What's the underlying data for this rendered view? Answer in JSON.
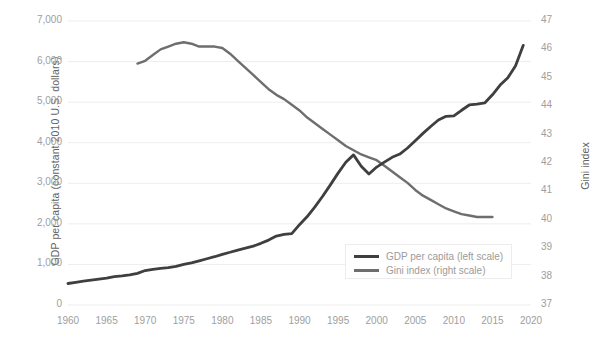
{
  "chart_data": {
    "type": "line",
    "title": "",
    "subtitle": "",
    "xlabel": "",
    "ylabel": "GDP per capita (constant 2010 U.S. dollars)",
    "y2label": "Gini index",
    "grid": true,
    "legend_position": "inside-bottom-right",
    "xlim": [
      1960,
      2020
    ],
    "xticks": [
      "1960",
      "1965",
      "1970",
      "1975",
      "1980",
      "1985",
      "1990",
      "1995",
      "2000",
      "2005",
      "2010",
      "2015",
      "2020"
    ],
    "ylim": [
      0,
      7000
    ],
    "yticks": [
      "0",
      "1,000",
      "2,000",
      "3,000",
      "4,000",
      "5,000",
      "6,000",
      "7,000"
    ],
    "y2lim": [
      37,
      47
    ],
    "y2ticks": [
      "37",
      "38",
      "39",
      "40",
      "41",
      "42",
      "43",
      "44",
      "45",
      "46",
      "47"
    ],
    "colors": {
      "gdp_line": "#3f3f3f",
      "gini_line": "#6e6e6e",
      "gridline": "#ededed",
      "tick_text": "#9e9e9e",
      "axis_title_text": "#636363",
      "legend_text": "#9b9b9b",
      "legend_border": "#ececec",
      "background": "#ffffff"
    },
    "series": [
      {
        "name": "GDP per capita (left scale)",
        "axis": "left",
        "legend_label": "GDP per capita (left scale)",
        "color": "#3f3f3f",
        "x": [
          1960,
          1961,
          1962,
          1963,
          1964,
          1965,
          1966,
          1967,
          1968,
          1969,
          1970,
          1971,
          1972,
          1973,
          1974,
          1975,
          1976,
          1977,
          1978,
          1979,
          1980,
          1981,
          1982,
          1983,
          1984,
          1985,
          1986,
          1987,
          1988,
          1989,
          1990,
          1991,
          1992,
          1993,
          1994,
          1995,
          1996,
          1997,
          1998,
          1999,
          2000,
          2001,
          2002,
          2003,
          2004,
          2005,
          2006,
          2007,
          2008,
          2009,
          2010,
          2011,
          2012,
          2013,
          2014,
          2015,
          2016,
          2017,
          2018,
          2019
        ],
        "values": [
          530,
          560,
          590,
          615,
          640,
          660,
          700,
          720,
          745,
          780,
          850,
          880,
          905,
          920,
          950,
          1000,
          1040,
          1090,
          1140,
          1190,
          1250,
          1300,
          1355,
          1400,
          1450,
          1520,
          1600,
          1700,
          1740,
          1760,
          1980,
          2180,
          2420,
          2680,
          2960,
          3250,
          3520,
          3700,
          3420,
          3230,
          3400,
          3520,
          3640,
          3720,
          3870,
          4050,
          4230,
          4400,
          4560,
          4650,
          4660,
          4800,
          4930,
          4950,
          4980,
          5180,
          5420,
          5600,
          5900,
          6400
        ]
      },
      {
        "name": "Gini index (right scale)",
        "axis": "right",
        "legend_label": "Gini index (right scale)",
        "color": "#6e6e6e",
        "x": [
          1969,
          1970,
          1971,
          1972,
          1973,
          1974,
          1975,
          1976,
          1977,
          1978,
          1979,
          1980,
          1981,
          1982,
          1983,
          1984,
          1985,
          1986,
          1987,
          1988,
          1989,
          1990,
          1991,
          1992,
          1993,
          1994,
          1995,
          1996,
          1997,
          1998,
          1999,
          2000,
          2001,
          2002,
          2003,
          2004,
          2005,
          2006,
          2007,
          2008,
          2009,
          2010,
          2011,
          2012,
          2013,
          2014,
          2015
        ],
        "values": [
          45.5,
          45.6,
          45.8,
          46.0,
          46.1,
          46.2,
          46.25,
          46.2,
          46.1,
          46.1,
          46.1,
          46.05,
          45.85,
          45.6,
          45.35,
          45.1,
          44.85,
          44.6,
          44.4,
          44.25,
          44.05,
          43.85,
          43.6,
          43.4,
          43.2,
          43.0,
          42.8,
          42.6,
          42.45,
          42.3,
          42.2,
          42.1,
          41.9,
          41.7,
          41.5,
          41.3,
          41.05,
          40.85,
          40.7,
          40.55,
          40.4,
          40.3,
          40.2,
          40.15,
          40.1,
          40.1,
          40.1
        ]
      }
    ]
  },
  "legend": {
    "gdp_label": "GDP per capita (left scale)",
    "gini_label": "Gini index (right scale)"
  },
  "axes": {
    "left_title": "GDP per capita (constant 2010 U.S. dollars)",
    "right_title": "Gini index"
  }
}
